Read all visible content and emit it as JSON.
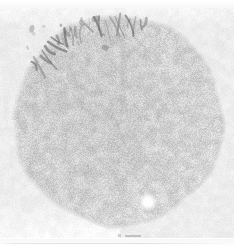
{
  "figure": {
    "title": "Grayscale micrograph of circular specimen",
    "width": 234,
    "height": 247,
    "background_color": "#ffffff",
    "plate": {
      "note": "light textured rectangular field",
      "fill_color": "#ededed",
      "left": 0,
      "top": 8,
      "right": 234,
      "bottom": 238
    }
  },
  "specimen": {
    "name": "circular-specimen",
    "shape": "circle",
    "center_x": 118,
    "center_y": 120,
    "radius": 104,
    "fill_color": "#c9c9c9",
    "rim_color": "#bdbdbd",
    "texture": "fine granular speckle"
  },
  "features": {
    "filament_cluster": {
      "name": "dark-filament-cluster",
      "location": "upper-left rim",
      "left": 24,
      "top": 10,
      "width": 82,
      "height": 44,
      "color": "#6b6b6b",
      "description": "elongated dark streaks radiating along the rim"
    },
    "bright_spot": {
      "name": "bright-spot",
      "center_x": 148,
      "center_y": 202,
      "radius": 5,
      "color": "#ffffff",
      "description": "small high-intensity blob in lower-right quadrant"
    }
  },
  "scale_bar": {
    "label": "",
    "line_color": "#b9b9b9",
    "length_px": 16,
    "position_x": 118,
    "position_y": 233
  },
  "palette": {
    "white": "#ffffff",
    "field_light": "#ededed",
    "specimen_gray": "#c9c9c9",
    "dark_feature": "#6b6b6b",
    "rule_gray": "#d4d4d4"
  }
}
